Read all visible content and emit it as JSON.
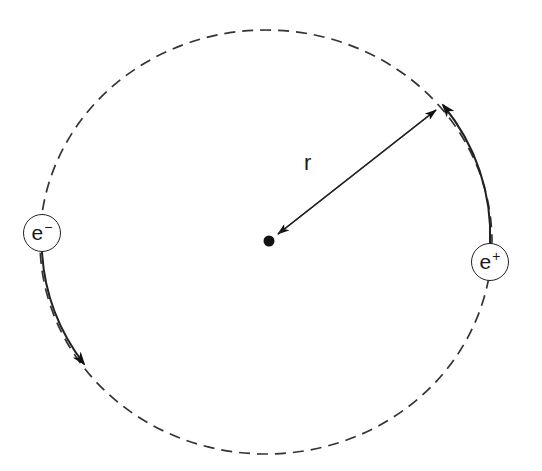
{
  "diagram": {
    "radius_label": "r",
    "particles": [
      {
        "id": "electron",
        "symbol": "e",
        "charge": "−",
        "position": "left",
        "motion": "counterclockwise, moving down"
      },
      {
        "id": "positron",
        "symbol": "e",
        "charge": "+",
        "position": "right",
        "motion": "counterclockwise, moving up"
      }
    ],
    "orbit": {
      "style": "dashed circle",
      "center": "dot"
    },
    "colors": {
      "stroke": "#222222",
      "background": "#ffffff"
    }
  }
}
